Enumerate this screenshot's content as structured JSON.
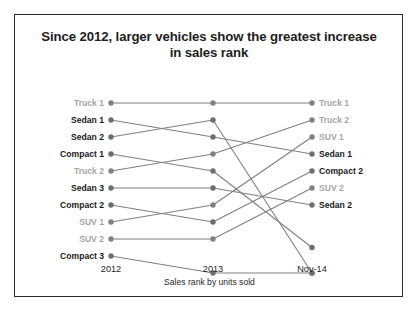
{
  "title": "Since 2012, larger vehicles show the greatest increase in sales rank",
  "axis_caption": "Sales rank by units sold",
  "colors": {
    "line": "#808080",
    "dot": "#808080",
    "dot_dark": "#6e6e6e",
    "label_dark": "#1a1a1a",
    "label_muted": "#a6a6a6",
    "frame": "#2b2b2b"
  },
  "categories": [
    "2012",
    "2013",
    "Nov-14"
  ],
  "left_labels": [
    {
      "text": "Truck 1",
      "tone": "muted"
    },
    {
      "text": "Sedan 1",
      "tone": "dark"
    },
    {
      "text": "Sedan 2",
      "tone": "dark"
    },
    {
      "text": "Compact 1",
      "tone": "dark"
    },
    {
      "text": "Truck 2",
      "tone": "muted"
    },
    {
      "text": "Sedan 3",
      "tone": "dark"
    },
    {
      "text": "Compact 2",
      "tone": "dark"
    },
    {
      "text": "SUV 1",
      "tone": "muted"
    },
    {
      "text": "SUV 2",
      "tone": "muted"
    },
    {
      "text": "Compact 3",
      "tone": "dark"
    }
  ],
  "right_labels": [
    {
      "text": "Truck 1",
      "tone": "muted"
    },
    {
      "text": "Truck 2",
      "tone": "muted"
    },
    {
      "text": "SUV 1",
      "tone": "muted"
    },
    {
      "text": "Sedan 1",
      "tone": "dark"
    },
    {
      "text": "Compact 2",
      "tone": "dark"
    },
    {
      "text": "SUV 2",
      "tone": "muted"
    },
    {
      "text": "Sedan 2",
      "tone": "dark"
    }
  ],
  "chart_data": {
    "type": "line",
    "subtype": "slopegraph",
    "title": "Since 2012, larger vehicles show the greatest increase in sales rank",
    "xlabel": "Sales rank by units sold",
    "ylabel": "",
    "x": [
      "2012",
      "2013",
      "Nov-14"
    ],
    "ylim": [
      11,
      1
    ],
    "y_inverted": true,
    "grid": false,
    "legend": "none",
    "note": "Values are sales ranks (1 = best). Rank slots 10 and 11 at the far right are unlabeled in the chart.",
    "series": [
      {
        "name": "Truck 1",
        "tone": "muted",
        "values": [
          1,
          1,
          1
        ]
      },
      {
        "name": "Sedan 1",
        "tone": "dark",
        "values": [
          2,
          3,
          4
        ]
      },
      {
        "name": "Sedan 2",
        "tone": "dark",
        "values": [
          3,
          2,
          11
        ]
      },
      {
        "name": "Compact 1",
        "tone": "dark",
        "values": [
          4,
          5,
          9.5
        ]
      },
      {
        "name": "Truck 2",
        "tone": "muted",
        "values": [
          5,
          4,
          2
        ]
      },
      {
        "name": "Sedan 3",
        "tone": "dark",
        "values": [
          6,
          6,
          7
        ]
      },
      {
        "name": "Compact 2",
        "tone": "dark",
        "values": [
          7,
          8,
          5
        ]
      },
      {
        "name": "SUV 1",
        "tone": "muted",
        "values": [
          8,
          7,
          3
        ]
      },
      {
        "name": "SUV 2",
        "tone": "muted",
        "values": [
          9,
          9,
          6
        ]
      },
      {
        "name": "Compact 3",
        "tone": "dark",
        "values": [
          10,
          11,
          11
        ]
      }
    ]
  }
}
